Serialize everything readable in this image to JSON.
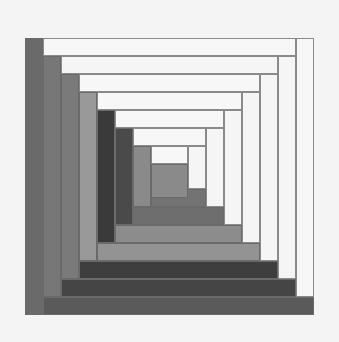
{
  "figure": {
    "background": "#f4f4f4",
    "outer": {
      "left": 25,
      "top": 38,
      "right": 314,
      "bottom": 315
    },
    "step": 18,
    "center": {
      "left": 151,
      "top": 164,
      "right": 188,
      "bottom": 198,
      "color": "#8a8a8a"
    },
    "rings": [
      {
        "left_color": "#6a6a6a",
        "bottom_color": "#5a5a5a",
        "top_color": "#f7f7f7",
        "right_color": "#f7f7f7"
      },
      {
        "left_color": "#777777",
        "bottom_color": "#454545",
        "top_color": "#f5f5f5",
        "right_color": "#f5f5f5"
      },
      {
        "left_color": "#7a7a7a",
        "bottom_color": "#3e3e3e",
        "top_color": "#f7f7f7",
        "right_color": "#f5f5f5"
      },
      {
        "left_color": "#999999",
        "bottom_color": "#939393",
        "top_color": "#f7f7f7",
        "right_color": "#f5f5f5"
      },
      {
        "left_color": "#3a3a3a",
        "bottom_color": "#8c8c8c",
        "top_color": "#f7f7f7",
        "right_color": "#f5f5f5"
      },
      {
        "left_color": "#4a4a4a",
        "bottom_color": "#6e6e6e",
        "top_color": "#f7f7f7",
        "right_color": "#f5f5f5"
      },
      {
        "left_color": "#8a8a8a",
        "bottom_color": "#737373",
        "top_color": "#f7f7f7",
        "right_color": "#f5f5f5"
      }
    ]
  }
}
